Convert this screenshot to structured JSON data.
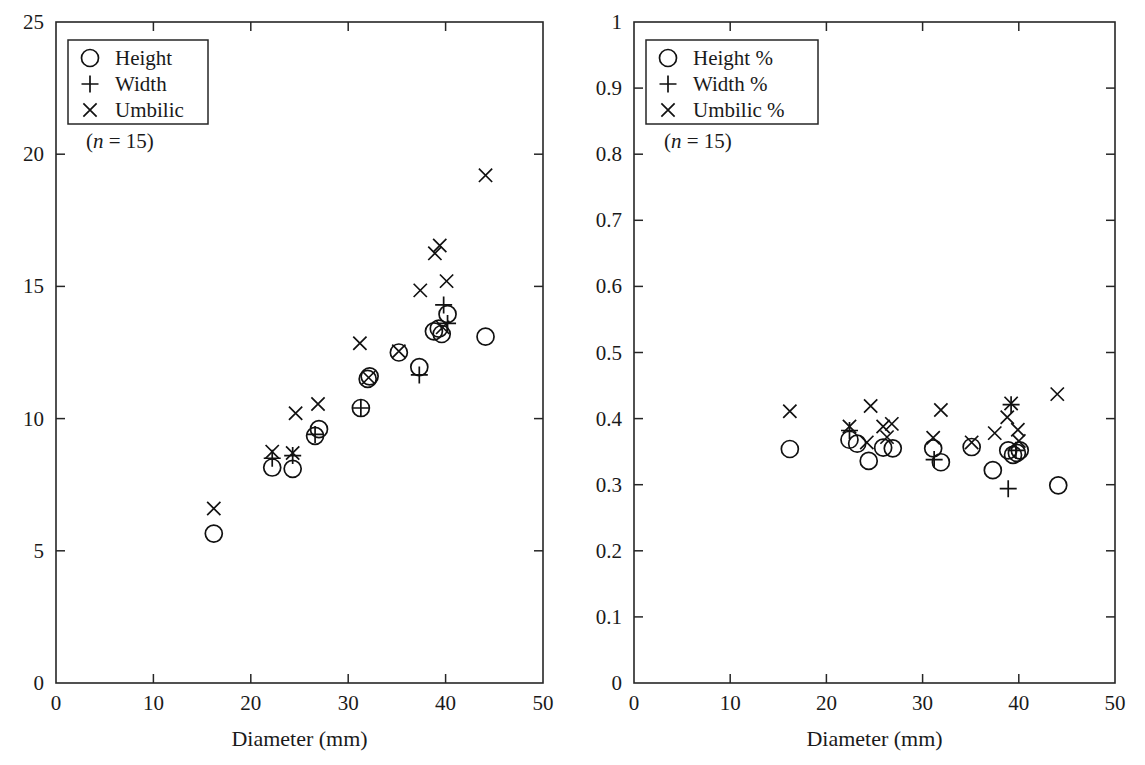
{
  "figure": {
    "background": "#ffffff",
    "ink_color": "#1a1a1a",
    "marker_color": "#111111",
    "width": 1145,
    "height": 765,
    "panel_count": 2
  },
  "chart_data": [
    {
      "type": "scatter",
      "panel": "left",
      "title": "",
      "xlabel": "Diameter (mm)",
      "ylabel": "",
      "xlim": [
        0,
        50
      ],
      "ylim": [
        0,
        25
      ],
      "xticks": [
        0,
        10,
        20,
        30,
        40,
        50
      ],
      "yticks": [
        0,
        5,
        10,
        15,
        20,
        25
      ],
      "xticklabels": [
        "0",
        "10",
        "20",
        "30",
        "40",
        "50"
      ],
      "yticklabels": [
        "0",
        "5",
        "10",
        "15",
        "20",
        "25"
      ],
      "grid": false,
      "legend_position": "upper-left",
      "annotation": "(n = 15)",
      "annotation_italic_part": "n",
      "series": [
        {
          "name": "Height",
          "marker": "circle",
          "points": [
            [
              16.2,
              5.65
            ],
            [
              22.2,
              8.15
            ],
            [
              24.3,
              8.1
            ],
            [
              26.6,
              9.35
            ],
            [
              27.0,
              9.6
            ],
            [
              31.3,
              10.4
            ],
            [
              32.0,
              11.5
            ],
            [
              32.2,
              11.6
            ],
            [
              35.2,
              12.5
            ],
            [
              37.3,
              11.95
            ],
            [
              38.8,
              13.3
            ],
            [
              39.3,
              13.4
            ],
            [
              39.6,
              13.2
            ],
            [
              40.2,
              13.95
            ],
            [
              44.1,
              13.1
            ]
          ]
        },
        {
          "name": "Width",
          "marker": "plus",
          "points": [
            [
              22.2,
              8.5
            ],
            [
              24.3,
              8.6
            ],
            [
              26.6,
              9.4
            ],
            [
              31.3,
              10.4
            ],
            [
              37.3,
              11.65
            ],
            [
              39.8,
              14.3
            ],
            [
              40.2,
              13.6
            ]
          ]
        },
        {
          "name": "Umbilic",
          "marker": "cross",
          "points": [
            [
              16.2,
              6.6
            ],
            [
              22.2,
              8.75
            ],
            [
              24.3,
              8.7
            ],
            [
              24.6,
              10.2
            ],
            [
              26.9,
              10.55
            ],
            [
              31.2,
              12.85
            ],
            [
              32.1,
              11.55
            ],
            [
              35.2,
              12.55
            ],
            [
              37.4,
              14.85
            ],
            [
              38.9,
              16.25
            ],
            [
              39.4,
              16.55
            ],
            [
              39.7,
              13.45
            ],
            [
              40.1,
              15.2
            ],
            [
              44.1,
              19.2
            ]
          ]
        }
      ]
    },
    {
      "type": "scatter",
      "panel": "right",
      "title": "",
      "xlabel": "Diameter (mm)",
      "ylabel": "",
      "xlim": [
        0,
        50
      ],
      "ylim": [
        0,
        1
      ],
      "xticks": [
        0,
        10,
        20,
        30,
        40,
        50
      ],
      "yticks": [
        0,
        0.1,
        0.2,
        0.3,
        0.4,
        0.5,
        0.6,
        0.7,
        0.8,
        0.9,
        1
      ],
      "xticklabels": [
        "0",
        "10",
        "20",
        "30",
        "40",
        "50"
      ],
      "yticklabels": [
        "0",
        "0.1",
        "0.2",
        "0.3",
        "0.4",
        "0.5",
        "0.6",
        "0.7",
        "0.8",
        "0.9",
        "1"
      ],
      "grid": false,
      "legend_position": "upper-left",
      "annotation": "(n = 15)",
      "annotation_italic_part": "n",
      "series": [
        {
          "name": "Height %",
          "marker": "circle",
          "points": [
            [
              16.2,
              0.354
            ],
            [
              22.4,
              0.368
            ],
            [
              23.2,
              0.362
            ],
            [
              24.4,
              0.336
            ],
            [
              25.9,
              0.356
            ],
            [
              26.9,
              0.355
            ],
            [
              31.1,
              0.355
            ],
            [
              31.9,
              0.334
            ],
            [
              35.1,
              0.357
            ],
            [
              37.3,
              0.322
            ],
            [
              38.9,
              0.352
            ],
            [
              39.4,
              0.345
            ],
            [
              39.8,
              0.348
            ],
            [
              40.1,
              0.352
            ],
            [
              44.1,
              0.299
            ]
          ]
        },
        {
          "name": "Width %",
          "marker": "plus",
          "points": [
            [
              22.4,
              0.382
            ],
            [
              31.2,
              0.338
            ],
            [
              39.2,
              0.421
            ],
            [
              39.7,
              0.352
            ],
            [
              38.9,
              0.294
            ]
          ]
        },
        {
          "name": "Umbilic %",
          "marker": "cross",
          "points": [
            [
              16.2,
              0.411
            ],
            [
              22.4,
              0.388
            ],
            [
              24.2,
              0.364
            ],
            [
              24.6,
              0.419
            ],
            [
              25.9,
              0.388
            ],
            [
              26.8,
              0.392
            ],
            [
              26.3,
              0.372
            ],
            [
              31.1,
              0.371
            ],
            [
              31.9,
              0.413
            ],
            [
              35.1,
              0.364
            ],
            [
              37.5,
              0.378
            ],
            [
              38.8,
              0.402
            ],
            [
              39.2,
              0.423
            ],
            [
              39.9,
              0.383
            ],
            [
              40.0,
              0.366
            ],
            [
              44.0,
              0.437
            ]
          ]
        }
      ]
    }
  ],
  "panels": {
    "left": {
      "legend": {
        "entries": [
          {
            "marker": "circle",
            "label": "Height"
          },
          {
            "marker": "plus",
            "label": "Width"
          },
          {
            "marker": "cross",
            "label": "Umbilic"
          }
        ],
        "note_prefix": "(",
        "note_italic": "n",
        "note_suffix": " = 15)"
      },
      "xaxis_title": "Diameter (mm)"
    },
    "right": {
      "legend": {
        "entries": [
          {
            "marker": "circle",
            "label": "Height %"
          },
          {
            "marker": "plus",
            "label": "Width %"
          },
          {
            "marker": "cross",
            "label": "Umbilic %"
          }
        ],
        "note_prefix": "(",
        "note_italic": "n",
        "note_suffix": " = 15)"
      },
      "xaxis_title": "Diameter (mm)"
    }
  }
}
